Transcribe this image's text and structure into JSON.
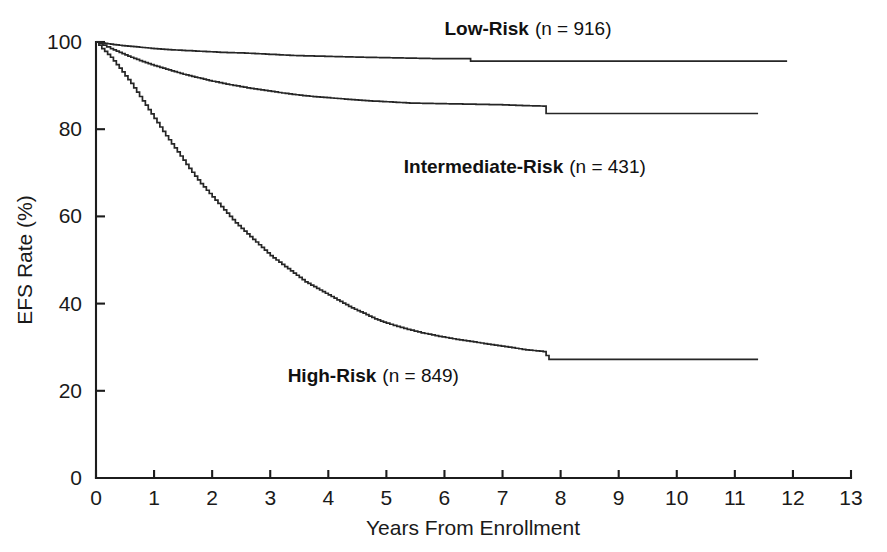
{
  "chart_data": {
    "type": "line",
    "title": "",
    "subtitle": "",
    "xlabel": "Years From Enrollment",
    "ylabel": "EFS Rate (%)",
    "xlim": [
      0,
      13
    ],
    "ylim": [
      0,
      100
    ],
    "xticks": [
      0,
      1,
      2,
      3,
      4,
      5,
      6,
      7,
      8,
      9,
      10,
      11,
      12,
      13
    ],
    "xtick_labels": [
      "0",
      "1",
      "2",
      "3",
      "4",
      "5",
      "6",
      "7",
      "8",
      "9",
      "10",
      "11",
      "12",
      "13"
    ],
    "yticks": [
      0,
      20,
      40,
      60,
      80,
      100
    ],
    "ytick_labels": [
      "0",
      "20",
      "40",
      "60",
      "80",
      "100"
    ],
    "grid": false,
    "legend_position": "inline-annotations",
    "plot_style": "kaplan-meier-step",
    "line_color": "#262626",
    "series": [
      {
        "name": "Low-Risk",
        "n": 916,
        "label_bold": "Low-Risk",
        "label_plain": "(n = 916)",
        "label_x": 6.0,
        "label_y": 101.5,
        "x": [
          0,
          0.15,
          0.3,
          0.5,
          0.75,
          1.0,
          1.3,
          1.6,
          1.9,
          2.2,
          2.5,
          2.8,
          3.1,
          3.4,
          3.7,
          4.0,
          4.3,
          4.6,
          5.0,
          5.4,
          5.8,
          6.2,
          6.4,
          6.45,
          7.0,
          7.6,
          8.2,
          9.0,
          10.0,
          11.0,
          11.9
        ],
        "y": [
          100,
          99.7,
          99.4,
          99.1,
          98.8,
          98.5,
          98.2,
          98.0,
          97.8,
          97.6,
          97.5,
          97.3,
          97.1,
          96.9,
          96.8,
          96.7,
          96.6,
          96.5,
          96.4,
          96.3,
          96.2,
          96.2,
          96.2,
          95.6,
          95.6,
          95.6,
          95.6,
          95.6,
          95.6,
          95.6,
          95.6
        ],
        "final_value": 95.6
      },
      {
        "name": "Intermediate-Risk",
        "n": 431,
        "label_bold": "Intermediate-Risk",
        "label_plain": "(n = 431)",
        "label_x": 5.3,
        "label_y": 70.0,
        "x": [
          0,
          0.12,
          0.25,
          0.4,
          0.6,
          0.8,
          1.0,
          1.25,
          1.5,
          1.75,
          2.0,
          2.3,
          2.6,
          2.9,
          3.2,
          3.5,
          3.8,
          4.1,
          4.4,
          4.7,
          5.0,
          5.4,
          5.8,
          6.2,
          6.6,
          7.0,
          7.4,
          7.7,
          7.75,
          8.3,
          9.0,
          10.0,
          11.0,
          11.4
        ],
        "y": [
          100,
          99.3,
          98.5,
          97.6,
          96.5,
          95.5,
          94.6,
          93.6,
          92.6,
          91.8,
          91.0,
          90.2,
          89.5,
          88.9,
          88.3,
          87.8,
          87.4,
          87.1,
          86.8,
          86.5,
          86.3,
          86.0,
          85.9,
          85.8,
          85.7,
          85.6,
          85.4,
          85.3,
          83.6,
          83.6,
          83.6,
          83.6,
          83.6,
          83.6
        ],
        "final_value": 83.6
      },
      {
        "name": "High-Risk",
        "n": 849,
        "label_bold": "High-Risk",
        "label_plain": "(n = 849)",
        "label_x": 3.3,
        "label_y": 22.0,
        "x": [
          0,
          0.1,
          0.25,
          0.4,
          0.6,
          0.8,
          1.0,
          1.2,
          1.4,
          1.6,
          1.8,
          2.0,
          2.2,
          2.4,
          2.6,
          2.8,
          3.0,
          3.2,
          3.4,
          3.6,
          3.8,
          4.0,
          4.2,
          4.4,
          4.6,
          4.8,
          5.0,
          5.3,
          5.6,
          5.9,
          6.2,
          6.5,
          6.8,
          7.1,
          7.4,
          7.7,
          7.8,
          8.5,
          9.5,
          10.5,
          11.4
        ],
        "y": [
          100,
          98.5,
          96.5,
          94.0,
          90.5,
          86.5,
          82.5,
          78.5,
          74.8,
          71.0,
          67.5,
          64.5,
          61.5,
          58.5,
          56.0,
          53.5,
          51.0,
          49.0,
          47.0,
          45.0,
          43.5,
          42.0,
          40.5,
          39.0,
          37.8,
          36.5,
          35.5,
          34.3,
          33.3,
          32.5,
          31.8,
          31.2,
          30.6,
          30.0,
          29.4,
          29.0,
          27.2,
          27.2,
          27.2,
          27.2,
          27.2
        ],
        "final_value": 27.2
      }
    ]
  },
  "axes": {
    "x_title": "Years From Enrollment",
    "y_title": "EFS Rate (%)"
  }
}
